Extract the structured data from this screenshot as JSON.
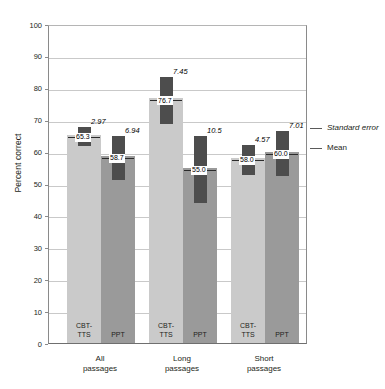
{
  "chart_data": {
    "type": "bar",
    "title": "",
    "xlabel": "",
    "ylabel": "Percent correct",
    "ylim": [
      0,
      100
    ],
    "yticks": [
      0,
      10,
      20,
      30,
      40,
      50,
      60,
      70,
      80,
      90,
      100
    ],
    "grid": true,
    "categories": [
      "All passages",
      "Long passages",
      "Short passages"
    ],
    "category_lines": [
      [
        "All",
        "passages"
      ],
      [
        "Long",
        "passages"
      ],
      [
        "Short",
        "passages"
      ]
    ],
    "series": [
      {
        "name": "CBT-TTS",
        "label_lines": [
          "CBT-",
          "TTS"
        ],
        "color": "#cacaca",
        "values": [
          65.3,
          76.7,
          58.0
        ],
        "errors": [
          2.97,
          7.45,
          4.57
        ],
        "value_labels": [
          "65.3",
          "76.7",
          "58.0"
        ],
        "error_labels": [
          "2.97",
          "7.45",
          "4.57"
        ]
      },
      {
        "name": "PPT",
        "label_lines": [
          "PPT",
          ""
        ],
        "color": "#9a9a9a",
        "values": [
          58.7,
          55.0,
          60.0
        ],
        "errors": [
          6.94,
          10.5,
          7.01
        ],
        "value_labels": [
          "58.7",
          "55.0",
          "60.0"
        ],
        "error_labels": [
          "6.94",
          "10.5",
          "7.01"
        ]
      }
    ],
    "legend": {
      "position": "right",
      "entries": [
        {
          "label": "Standard error",
          "style": "italic"
        },
        {
          "label": "Mean",
          "style": "normal"
        }
      ]
    },
    "colors": {
      "cbt_tts": "#cacaca",
      "ppt": "#9a9a9a",
      "error_block": "#4d4d4d",
      "gridline": "#c9c9c9",
      "axis": "#8a8a8a"
    }
  }
}
